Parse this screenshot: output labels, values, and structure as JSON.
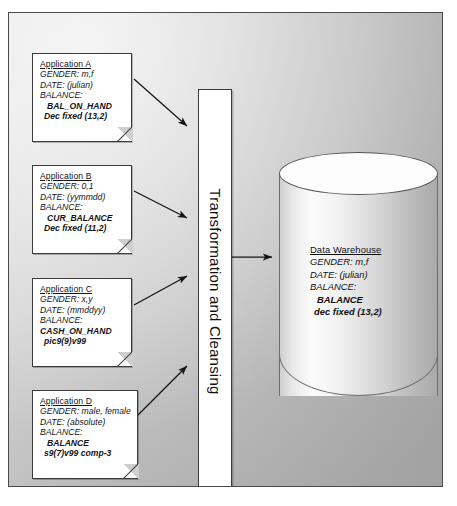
{
  "diagram": {
    "process_label": "Transformation and Cleansing",
    "sources": [
      {
        "id": "application-a",
        "title": "Application A",
        "gender": "GENDER: m,f",
        "date": "DATE: (julian)",
        "balance_label": "BALANCE:",
        "balance_field": "BAL_ON_HAND",
        "balance_format": "Dec fixed (13,2)"
      },
      {
        "id": "application-b",
        "title": "Application B",
        "gender": "GENDER: 0,1",
        "date": "DATE: (yymmdd)",
        "balance_label": "BALANCE:",
        "balance_field": "CUR_BALANCE",
        "balance_format": "Dec fixed (11,2)"
      },
      {
        "id": "application-c",
        "title": "Application C",
        "gender": "GENDER: x,y",
        "date": "DATE: (mmddyy)",
        "balance_label": "BALANCE:",
        "balance_field": "CASH_ON_HAND",
        "balance_format": "pic9(9)v99"
      },
      {
        "id": "application-d",
        "title": "Application D",
        "gender": "GENDER: male, female",
        "date": "DATE: (absolute)",
        "balance_label": "BALANCE:",
        "balance_field": "BALANCE",
        "balance_format": "s9(7)v99 comp-3"
      }
    ],
    "target": {
      "id": "data-warehouse",
      "title": "Data Warehouse",
      "gender": "GENDER: m,f",
      "date": "DATE: (julian)",
      "balance_label": "BALANCE:",
      "balance_field": "BALANCE",
      "balance_format": "dec fixed (13,2)"
    },
    "colors": {
      "line": "#3b3b3b",
      "arrow": "#1a1a1a",
      "doc_fill": "#ffffff",
      "background": "#cfcfcf"
    }
  }
}
